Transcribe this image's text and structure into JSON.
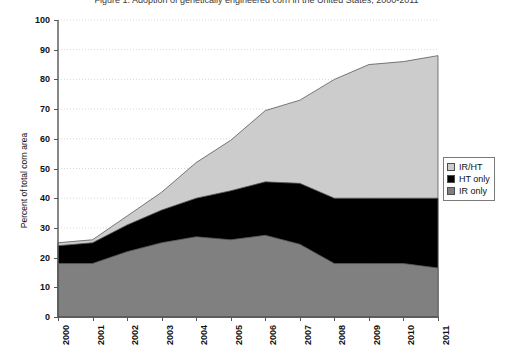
{
  "chart_data": {
    "type": "area",
    "stacked": true,
    "title": "Figure 1. Adoption of genetically engineered corn in the United States, 2000-2011",
    "xlabel": "",
    "ylabel": "Percent of total corn area",
    "x": [
      2000,
      2001,
      2002,
      2003,
      2004,
      2005,
      2006,
      2007,
      2008,
      2009,
      2010,
      2011
    ],
    "xticklabels": [
      "2000",
      "2001",
      "2002",
      "2003",
      "2004",
      "2005",
      "2006",
      "2007",
      "2008",
      "2009",
      "2010",
      "2011"
    ],
    "yticklabels": [
      "0",
      "10",
      "20",
      "30",
      "40",
      "50",
      "60",
      "70",
      "80",
      "90",
      "100"
    ],
    "ylim": [
      0,
      100
    ],
    "ytick_step": 10,
    "grid": true,
    "grid_style": "dotted-horizontal",
    "legend_position": "right",
    "series": [
      {
        "name": "IR only",
        "color": "#808080",
        "values": [
          18,
          18,
          22,
          25,
          27,
          26,
          27.5,
          24.5,
          18,
          18,
          18,
          16.5
        ]
      },
      {
        "name": "HT only",
        "color": "#000000",
        "values": [
          6,
          7,
          9,
          11,
          13,
          16.5,
          18,
          20.5,
          22,
          22,
          22,
          23.5
        ]
      },
      {
        "name": "IR/HT",
        "color": "#cccccc",
        "values": [
          1,
          1,
          3,
          6,
          12,
          17,
          24,
          28,
          40,
          45,
          46,
          48
        ]
      }
    ],
    "cumulative_tops": {
      "ir_only": [
        18,
        18,
        22,
        25,
        27,
        26,
        27.5,
        24.5,
        18,
        18,
        18,
        16.5
      ],
      "ir_plus_ht": [
        24,
        25,
        31,
        36,
        40,
        42.5,
        45.5,
        45,
        40,
        40,
        40,
        40
      ],
      "total": [
        25,
        26,
        34,
        42,
        52,
        59.5,
        69.5,
        73,
        80,
        85,
        86,
        88
      ]
    }
  },
  "legend": {
    "items": [
      {
        "label": "IR/HT",
        "color": "#cccccc"
      },
      {
        "label": "HT only",
        "color": "#000000"
      },
      {
        "label": "IR only",
        "color": "#808080"
      }
    ]
  }
}
